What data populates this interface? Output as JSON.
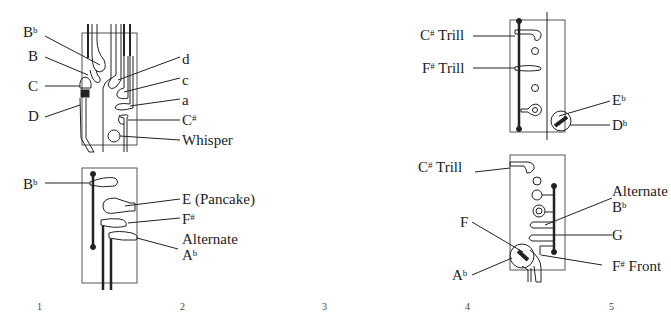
{
  "diagram": {
    "panels": [
      {
        "id": "top-left",
        "labels": [
          {
            "base": "B",
            "sup": "b",
            "text": "Bb"
          },
          {
            "base": "B",
            "sup": "",
            "text": "B"
          },
          {
            "base": "C",
            "sup": "",
            "text": "C"
          },
          {
            "base": "D",
            "sup": "",
            "text": "D"
          },
          {
            "base": "d",
            "sup": "",
            "text": "d"
          },
          {
            "base": "c",
            "sup": "",
            "text": "c"
          },
          {
            "base": "a",
            "sup": "",
            "text": "a"
          },
          {
            "base": "C",
            "sup": "#",
            "text": "C#"
          },
          {
            "base": "Whisper",
            "sup": "",
            "text": "Whisper"
          }
        ]
      },
      {
        "id": "bottom-left",
        "labels": [
          {
            "base": "B",
            "sup": "b",
            "text": "Bb"
          },
          {
            "base": "E (Pancake)",
            "sup": "",
            "text": "E (Pancake)"
          },
          {
            "base": "F",
            "sup": "#",
            "text": "F#"
          },
          {
            "base": "Alternate",
            "sup": "",
            "text": "Alternate"
          },
          {
            "base": "A",
            "sup": "b",
            "text": "Ab"
          }
        ]
      },
      {
        "id": "top-right",
        "labels": [
          {
            "base": "C",
            "sup": "#",
            "tail": " Trill",
            "text": "C# Trill"
          },
          {
            "base": "F",
            "sup": "#",
            "tail": " Trill",
            "text": "F# Trill"
          },
          {
            "base": "E",
            "sup": "b",
            "text": "Eb"
          },
          {
            "base": "D",
            "sup": "b",
            "text": "Db"
          }
        ]
      },
      {
        "id": "bottom-right",
        "labels": [
          {
            "base": "C",
            "sup": "#",
            "tail": " Trill",
            "text": "C# Trill"
          },
          {
            "base": "Alternate",
            "sup": "",
            "text": "Alternate"
          },
          {
            "base": "B",
            "sup": "b",
            "text": "Bb"
          },
          {
            "base": "F",
            "sup": "",
            "text": "F"
          },
          {
            "base": "G",
            "sup": "",
            "text": "G"
          },
          {
            "base": "A",
            "sup": "b",
            "text": "Ab"
          },
          {
            "base": "F",
            "sup": "#",
            "tail": " Front",
            "text": "F# Front"
          }
        ]
      }
    ],
    "page_numbers": [
      "1",
      "2",
      "3",
      "4",
      "5"
    ]
  }
}
